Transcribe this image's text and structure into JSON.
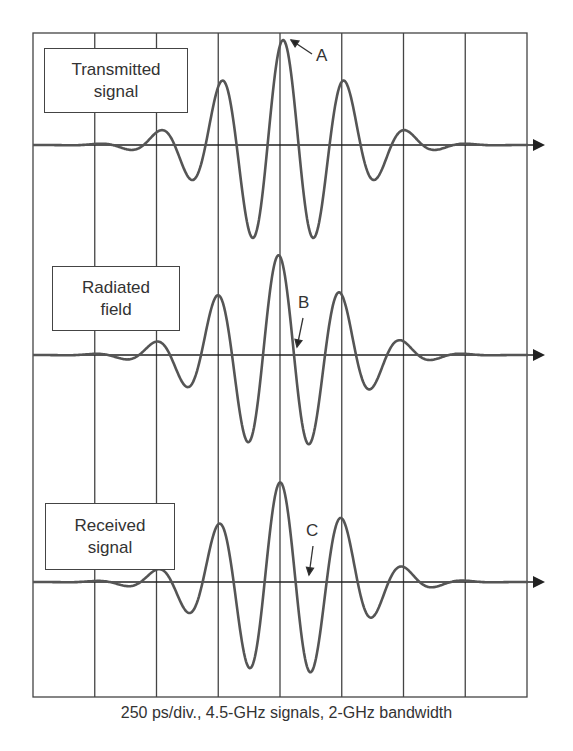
{
  "chart_data": {
    "type": "line",
    "title": "",
    "caption": "250 ps/div., 4.5-GHz signals, 2-GHz bandwidth",
    "xlabel": "Time (250 ps/div.)",
    "ylabel": "",
    "grid": {
      "vertical_divisions": 8,
      "horizontal_lines": "baseline per trace"
    },
    "x_divisions_ps": [
      0,
      250,
      500,
      750,
      1000,
      1250,
      1500,
      1750,
      2000
    ],
    "series": [
      {
        "name": "Transmitted signal",
        "baseline_y": 145,
        "peak_x_div": 4.05,
        "amplitude": 1.0,
        "carrier_ghz": 4.5,
        "bandwidth_ghz": 2,
        "marker": "A",
        "marker_desc": "main positive peak"
      },
      {
        "name": "Radiated field",
        "baseline_y": 355,
        "peak_x_div": 4.0,
        "amplitude": 0.95,
        "carrier_ghz": 4.5,
        "bandwidth_ghz": 2,
        "marker": "B",
        "marker_desc": "zero crossing after main peak"
      },
      {
        "name": "Received signal",
        "baseline_y": 582,
        "peak_x_div": 4.05,
        "amplitude": 0.95,
        "carrier_ghz": 4.5,
        "bandwidth_ghz": 2,
        "marker": "C",
        "marker_desc": "zero crossing after main peak"
      }
    ],
    "annotations": [
      "A",
      "B",
      "C"
    ]
  },
  "labels": {
    "transmitted": [
      "Transmitted",
      "signal"
    ],
    "radiated": [
      "Radiated",
      "field"
    ],
    "received": [
      "Received",
      "signal"
    ],
    "marker_a": "A",
    "marker_b": "B",
    "marker_c": "C"
  },
  "colors": {
    "trace": "#555555",
    "grid": "#444444",
    "axis": "#222222"
  }
}
